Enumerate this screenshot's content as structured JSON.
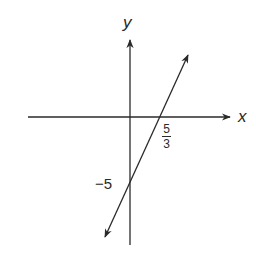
{
  "diagram": {
    "type": "coordinate-plane-line",
    "equation": "y = 3x - 5",
    "axis_labels": {
      "x": "x",
      "y": "y"
    },
    "x_intercept": {
      "numerator": "5",
      "denominator": "3"
    },
    "y_intercept": {
      "label": "−5",
      "value": -5
    },
    "colors": {
      "stroke": "#2a2a2a",
      "background": "#ffffff"
    }
  }
}
